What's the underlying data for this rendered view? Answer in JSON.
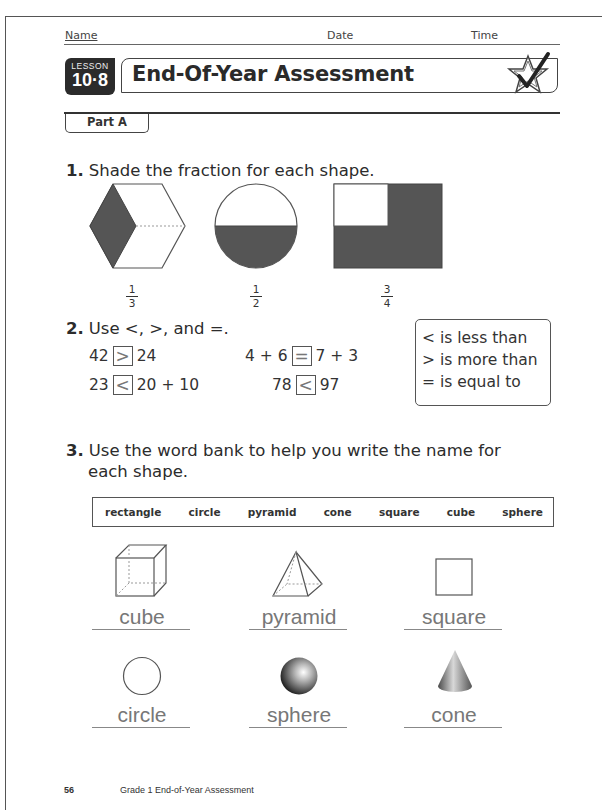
{
  "header": {
    "name_label": "Name",
    "date_label": "Date",
    "time_label": "Time"
  },
  "lesson": {
    "label": "LESSON",
    "number": "10·8",
    "title": "End-Of-Year Assessment",
    "icon": "star-check-icon"
  },
  "part": {
    "label": "Part A"
  },
  "question1": {
    "number": "1.",
    "prompt": "Shade the fraction for each shape.",
    "items": [
      {
        "shape": "hexagon",
        "numerator": "1",
        "denominator": "3"
      },
      {
        "shape": "circle",
        "numerator": "1",
        "denominator": "2"
      },
      {
        "shape": "rectangle",
        "numerator": "3",
        "denominator": "4"
      }
    ]
  },
  "question2": {
    "number": "2.",
    "prompt": "Use <, >, and =.",
    "comparisons": [
      {
        "left": "42",
        "answer": ">",
        "right": "24"
      },
      {
        "left": "4 + 6",
        "answer": "=",
        "right": "7 + 3"
      },
      {
        "left": "23",
        "answer": "<",
        "right": "20 + 10"
      },
      {
        "left": "78",
        "answer": "<",
        "right": "97"
      }
    ],
    "legend": [
      "< is less than",
      "> is more than",
      "= is equal to"
    ]
  },
  "question3": {
    "number": "3.",
    "prompt_line1": "Use the word bank to help you write the name for",
    "prompt_line2": "each shape.",
    "word_bank": [
      "rectangle",
      "circle",
      "pyramid",
      "cone",
      "square",
      "cube",
      "sphere"
    ],
    "answers": [
      {
        "shape": "cube",
        "text": "cube"
      },
      {
        "shape": "pyramid",
        "text": "pyramid"
      },
      {
        "shape": "square",
        "text": "square"
      },
      {
        "shape": "circle",
        "text": "circle"
      },
      {
        "shape": "sphere",
        "text": "sphere"
      },
      {
        "shape": "cone",
        "text": "cone"
      }
    ]
  },
  "footer": {
    "page_number": "56",
    "text": "Grade 1 End-of-Year Assessment"
  }
}
